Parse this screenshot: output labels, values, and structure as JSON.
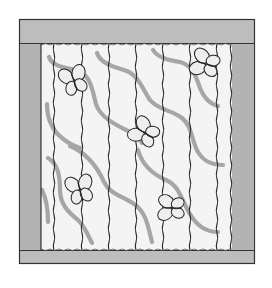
{
  "figure": {
    "colors": {
      "background": "#ffffff",
      "border": "#bdbdbd",
      "border_outline": "#333333",
      "strip_fill": "#f4f4f4",
      "stitch_line": "#222222",
      "vine": "#a6a6a6",
      "butterfly_fill": "#eeeeee",
      "butterfly_outline": "#222222"
    },
    "frame": {
      "x": 19,
      "y": 19,
      "width": 235,
      "height": 244
    },
    "border_widths": {
      "top": 24,
      "bottom": 13,
      "left": 22,
      "right": 22
    },
    "strip_lines_x": [
      41,
      54,
      82,
      109,
      136,
      163,
      190,
      217,
      232
    ],
    "butterfly_count": 5,
    "butterflies": [
      {
        "cx": 74,
        "cy": 81,
        "rotate": -20
      },
      {
        "cx": 206,
        "cy": 64,
        "rotate": -75
      },
      {
        "cx": 145,
        "cy": 133,
        "rotate": -60
      },
      {
        "cx": 80,
        "cy": 190,
        "rotate": -15
      },
      {
        "cx": 172,
        "cy": 208,
        "rotate": -90
      }
    ],
    "vine_count": 8
  }
}
